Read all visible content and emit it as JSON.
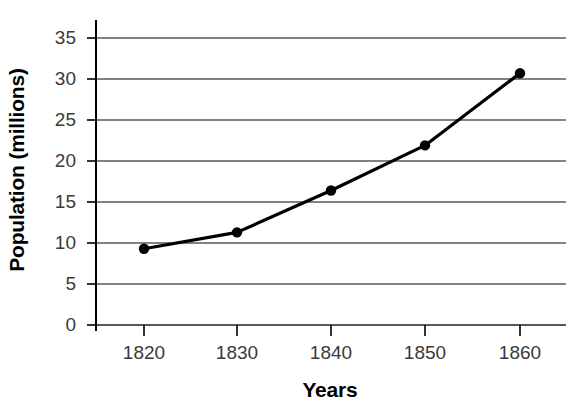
{
  "chart_data": {
    "type": "line",
    "title": "",
    "xlabel": "Years",
    "ylabel": "Population (millions)",
    "categories": [
      "1820",
      "1830",
      "1840",
      "1850",
      "1860"
    ],
    "x": [
      1820,
      1830,
      1840,
      1850,
      1860
    ],
    "values": [
      9.3,
      11.3,
      16.4,
      21.9,
      30.7
    ],
    "series": [
      {
        "name": "Population",
        "values": [
          9.3,
          11.3,
          16.4,
          21.9,
          30.7
        ]
      }
    ],
    "xlim": [
      1815,
      1865
    ],
    "ylim": [
      0,
      35
    ],
    "ytick_labels": [
      "0",
      "5",
      "10",
      "15",
      "20",
      "25",
      "30",
      "35"
    ],
    "yticks": [
      0,
      5,
      10,
      15,
      20,
      25,
      30,
      35
    ],
    "xtick_labels": [
      "1820",
      "1830",
      "1840",
      "1850",
      "1860"
    ],
    "grid": "horizontal",
    "legend": "none",
    "line_color": "#000000",
    "marker": "circle",
    "marker_color": "#000000",
    "axis_color": "#000000",
    "grid_color": "#595959",
    "tick_label_color": "#3a3a3a"
  }
}
